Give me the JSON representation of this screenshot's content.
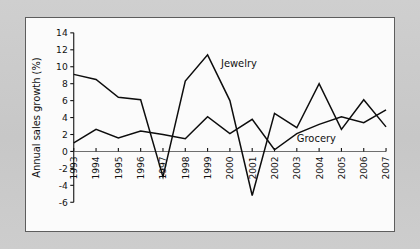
{
  "figure": {
    "panel_background": "#fbfbfb",
    "outer_background": "#c9c9c9",
    "border_color": "#5d5d5d",
    "line_color": "#0d0d0d"
  },
  "chart_data": {
    "type": "line",
    "title": "",
    "xlabel": "",
    "ylabel": "Annual sales growth (%)",
    "grid": false,
    "legend_position": "inline-annotation",
    "categories": [
      "1993",
      "1994",
      "1995",
      "1996",
      "1997",
      "1998",
      "1999",
      "2000",
      "2001",
      "2002",
      "2003",
      "2004",
      "2005",
      "2006",
      "2007"
    ],
    "x": [
      1993,
      1994,
      1995,
      1996,
      1997,
      1998,
      1999,
      2000,
      2001,
      2002,
      2003,
      2004,
      2005,
      2006,
      2007
    ],
    "xlim": [
      1993,
      2007
    ],
    "ylim": [
      -6,
      14
    ],
    "yticks": [
      -6,
      -4,
      -2,
      0,
      2,
      4,
      6,
      8,
      10,
      12,
      14
    ],
    "ytick_labels": [
      "-6",
      "-4",
      "-2",
      "0",
      "2",
      "4",
      "6",
      "8",
      "10",
      "12",
      "14"
    ],
    "xtick_labels": [
      "1993",
      "1994",
      "1995",
      "1996",
      "1997",
      "1998",
      "1999",
      "2000",
      "2001",
      "2002",
      "2003",
      "2004",
      "2005",
      "2006",
      "2007"
    ],
    "series": [
      {
        "name": "Jewelry",
        "label": "Jewelry",
        "values": [
          9.1,
          8.5,
          6.4,
          6.1,
          -3.0,
          8.3,
          11.4,
          6.0,
          -5.2,
          4.5,
          2.8,
          8.0,
          2.6,
          6.1,
          2.9
        ]
      },
      {
        "name": "Grocery",
        "label": "Grocery",
        "values": [
          1.0,
          2.6,
          1.6,
          2.4,
          2.0,
          1.5,
          4.1,
          2.1,
          3.8,
          0.2,
          2.1,
          3.2,
          4.1,
          3.4,
          4.9
        ]
      }
    ],
    "annotations": [
      {
        "text": "Jewelry",
        "x": 1999.6,
        "y": 10.0
      },
      {
        "text": "Grocery",
        "x": 2003.0,
        "y": 1.1
      }
    ]
  }
}
